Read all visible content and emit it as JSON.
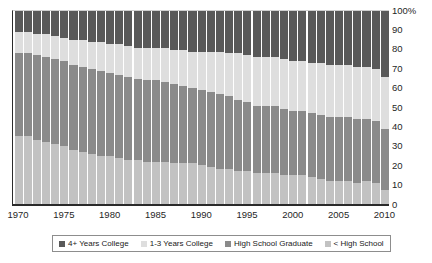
{
  "chart_data": {
    "type": "bar",
    "stacked": true,
    "stack_mode": "percent",
    "title": "",
    "subtitle": "",
    "xlabel": "",
    "ylabel": "",
    "ylim": [
      0,
      100
    ],
    "y_ticks": [
      "0",
      "10",
      "20",
      "30",
      "40",
      "50",
      "60",
      "70",
      "80",
      "90",
      "100%"
    ],
    "y_tick_values": [
      0,
      10,
      20,
      30,
      40,
      50,
      60,
      70,
      80,
      90,
      100
    ],
    "grid": false,
    "legend_position": "bottom",
    "x_tick_labels": [
      "1970",
      "1975",
      "1980",
      "1985",
      "1990",
      "1995",
      "2000",
      "2005",
      "2010"
    ],
    "x_tick_values": [
      1970,
      1975,
      1980,
      1985,
      1990,
      1995,
      2000,
      2005,
      2010
    ],
    "categories": [
      "1970",
      "1971",
      "1972",
      "1973",
      "1974",
      "1975",
      "1976",
      "1977",
      "1978",
      "1979",
      "1980",
      "1981",
      "1982",
      "1983",
      "1984",
      "1985",
      "1986",
      "1987",
      "1988",
      "1989",
      "1990",
      "1991",
      "1992",
      "1993",
      "1994",
      "1995",
      "1996",
      "1997",
      "1998",
      "1999",
      "2000",
      "2001",
      "2002",
      "2003",
      "2004",
      "2005",
      "2006",
      "2007",
      "2008",
      "2009",
      "2010"
    ],
    "series": [
      {
        "name": "4+ Years College",
        "color": "#595959",
        "stack_order": 0,
        "values": [
          11,
          11,
          12,
          12,
          13,
          14,
          15,
          15,
          16,
          16,
          17,
          17,
          18,
          19,
          19,
          19,
          19,
          20,
          20,
          21,
          21,
          21,
          21,
          22,
          22,
          23,
          24,
          24,
          24,
          25,
          26,
          26,
          27,
          27,
          28,
          28,
          28,
          29,
          29,
          30,
          34
        ]
      },
      {
        "name": "1-3 Years College",
        "color": "#dedede",
        "stack_order": 1,
        "values": [
          11,
          11,
          11,
          12,
          12,
          12,
          13,
          14,
          14,
          15,
          15,
          16,
          16,
          16,
          17,
          17,
          18,
          18,
          19,
          19,
          20,
          21,
          22,
          22,
          24,
          24,
          25,
          25,
          25,
          26,
          26,
          26,
          26,
          27,
          27,
          27,
          27,
          27,
          27,
          27,
          27
        ]
      },
      {
        "name": "High School Graduate",
        "color": "#8a8a8a",
        "stack_order": 2,
        "values": [
          43,
          43,
          44,
          44,
          44,
          44,
          44,
          44,
          44,
          44,
          43,
          43,
          43,
          42,
          42,
          42,
          41,
          41,
          40,
          39,
          39,
          39,
          39,
          38,
          37,
          36,
          35,
          35,
          35,
          34,
          33,
          33,
          33,
          33,
          33,
          33,
          33,
          33,
          32,
          32,
          32
        ]
      },
      {
        "name": "< High School",
        "color": "#c2c2c2",
        "stack_order": 3,
        "values": [
          35,
          35,
          33,
          32,
          31,
          30,
          28,
          27,
          26,
          25,
          25,
          24,
          23,
          23,
          22,
          22,
          22,
          21,
          21,
          21,
          20,
          19,
          18,
          18,
          17,
          17,
          16,
          16,
          16,
          15,
          15,
          15,
          14,
          13,
          12,
          12,
          12,
          11,
          12,
          11,
          7
        ]
      }
    ],
    "legend": [
      {
        "label": "4+ Years College",
        "color": "#595959"
      },
      {
        "label": "1-3 Years College",
        "color": "#dedede"
      },
      {
        "label": "High School Graduate",
        "color": "#8a8a8a"
      },
      {
        "label": "< High School",
        "color": "#c2c2c2"
      }
    ]
  }
}
